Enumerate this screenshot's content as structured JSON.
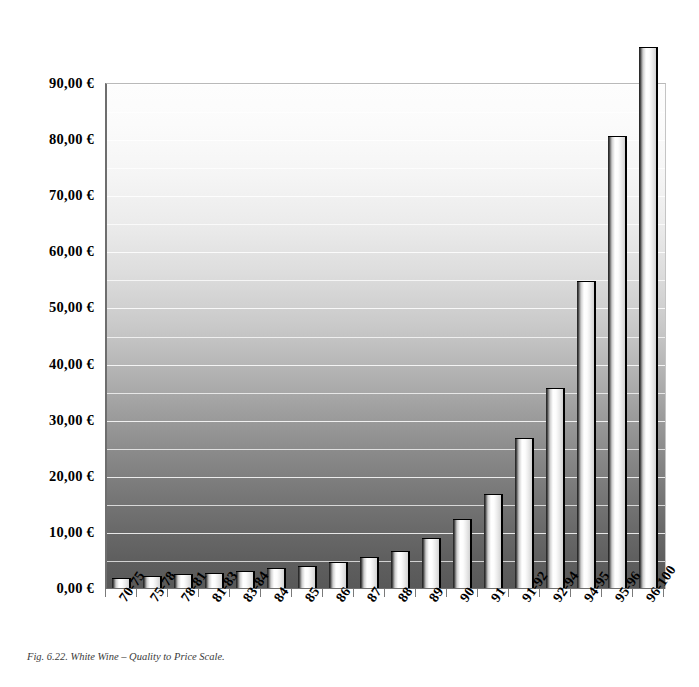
{
  "figure": {
    "caption": "Fig. 6.22. White Wine – Quality to Price Scale.",
    "background_top_color": "#fdfdfd",
    "background_bottom_color": "#585858",
    "bar_highlight_color": "#ffffff",
    "bar_outline_color": "#000000",
    "gridline_color": "#ffffff"
  },
  "chart_data": {
    "type": "bar",
    "title": "Fig. 6.22. White Wine – Quality to Price Scale.",
    "xlabel": "",
    "ylabel": "",
    "currency": "€",
    "grid": true,
    "legend": null,
    "ylim": [
      0,
      90
    ],
    "yticks": [
      0,
      10,
      20,
      30,
      40,
      50,
      60,
      70,
      80,
      90
    ],
    "ytick_labels": [
      "0,00 €",
      "10,00 €",
      "20,00 €",
      "30,00 €",
      "40,00 €",
      "50,00 €",
      "60,00 €",
      "70,00 €",
      "80,00 €",
      "90,00 €"
    ],
    "minor_gridline_step": 5,
    "categories": [
      "70-75",
      "75-78",
      "78-81",
      "81-83",
      "83-84",
      "84",
      "85",
      "86",
      "87",
      "88",
      "89",
      "90",
      "91",
      "91-92",
      "92-94",
      "94-95",
      "95-96",
      "96-100"
    ],
    "values": [
      1.7,
      2.1,
      2.5,
      2.7,
      3.1,
      3.6,
      4.0,
      4.6,
      5.6,
      6.6,
      8.9,
      12.3,
      16.7,
      26.7,
      35.6,
      54.7,
      80.6,
      96.5
    ],
    "value_labels": [
      "1,70 €",
      "2,10 €",
      "2,50 €",
      "2,70 €",
      "3,10 €",
      "3,60 €",
      "4,00 €",
      "4,60 €",
      "5,60 €",
      "6,60 €",
      "8,90 €",
      "12,30 €",
      "16,70 €",
      "26,70 €",
      "35,60 €",
      "54,70 €",
      "80,60 €",
      "96,50 €"
    ]
  }
}
